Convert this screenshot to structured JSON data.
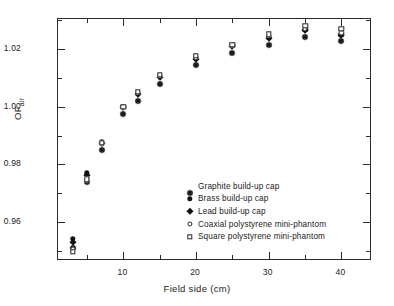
{
  "chart_data": {
    "type": "scatter",
    "title": "",
    "xlabel": "Field side (cm)",
    "ylabel_main": "OF",
    "ylabel_sub": "air",
    "xlim": [
      1.0,
      44.2
    ],
    "ylim": [
      0.9465,
      1.0305
    ],
    "grid": false,
    "legend_position": "inside-center-lower",
    "xticks_major": [
      10,
      20,
      30,
      40
    ],
    "xticks_major_labels": [
      "10",
      "20",
      "30",
      "40"
    ],
    "xticks_minor": [
      5,
      15,
      25,
      35
    ],
    "yticks_major": [
      0.96,
      0.98,
      1.0,
      1.02
    ],
    "yticks_major_labels": [
      "0.96",
      "0.98",
      "1.00",
      "1.02"
    ],
    "yticks_minor": [
      0.95,
      0.97,
      0.99,
      1.01,
      1.03
    ],
    "x": [
      3,
      5,
      7,
      10,
      12,
      15,
      20,
      25,
      30,
      35,
      40
    ],
    "series": [
      {
        "name": "Graphite build-up cap",
        "marker": "star-asterisk",
        "values": [
          0.9535,
          0.9765,
          0.9875,
          1.0,
          1.0045,
          1.0105,
          1.0168,
          1.0212,
          1.024,
          1.0268,
          1.0252
        ]
      },
      {
        "name": "Brass build-up cap",
        "marker": "filled-circle",
        "values": [
          0.9542,
          0.977,
          0.9877,
          1.0,
          1.0046,
          1.0107,
          1.017,
          1.0214,
          1.0242,
          1.0268,
          1.025
        ]
      },
      {
        "name": "Lead build-up cap",
        "marker": "filled-diamond",
        "values": [
          0.953,
          0.9762,
          0.9874,
          1.0,
          1.0044,
          1.0104,
          1.0166,
          1.021,
          1.0238,
          1.0266,
          1.0248
        ]
      },
      {
        "name": "Coaxial polystyrene mini-phantom",
        "marker": "open-circle",
        "values": [
          0.9508,
          0.9752,
          0.9872,
          1.0,
          1.0048,
          1.0108,
          1.0172,
          1.0214,
          1.0246,
          1.0272,
          1.0258
        ]
      },
      {
        "name": "Square polystyrene mini-phantom",
        "marker": "open-square",
        "values": [
          0.9496,
          0.9748,
          0.9876,
          1.0,
          1.0052,
          1.0112,
          1.0178,
          1.0216,
          1.0252,
          1.0282,
          1.0272
        ]
      }
    ]
  },
  "legend": {
    "items": [
      {
        "label": "Graphite build-up cap",
        "marker": "star-asterisk"
      },
      {
        "label": "Brass build-up cap",
        "marker": "filled-circle"
      },
      {
        "label": "Lead build-up cap",
        "marker": "filled-diamond"
      },
      {
        "label": "Coaxial polystyrene mini-phantom",
        "marker": "open-circle"
      },
      {
        "label": "Square polystyrene mini-phantom",
        "marker": "open-square"
      }
    ]
  },
  "colors": {
    "axis": "#2b2b2b",
    "marker": "#111111",
    "background": "#ffffff"
  }
}
